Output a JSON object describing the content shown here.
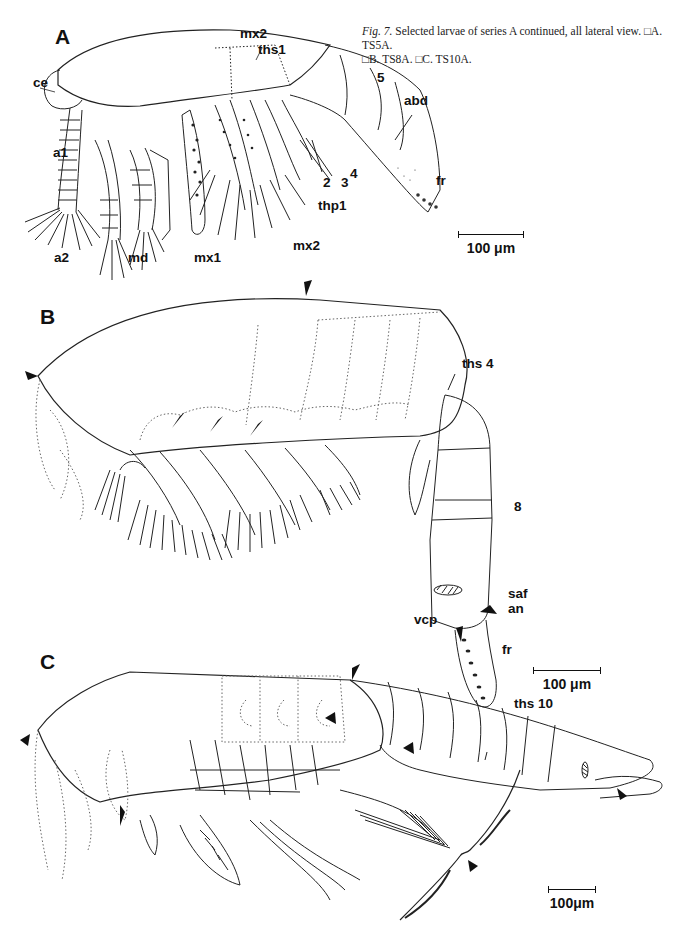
{
  "caption": {
    "fig_ref": "Fig. 7.",
    "text_line1": " Selected larvae of series A continued, all lateral view. □A. TS5A.",
    "text_line2": "□B. TS8A. □C. TS10A."
  },
  "panels": {
    "A": {
      "letter": "A",
      "stage": "TS5A",
      "labels": {
        "ce": "ce",
        "a1": "a1",
        "a2": "a2",
        "md": "md",
        "mx1": "mx1",
        "mx2_top": "mx2",
        "mx2_bottom": "mx2",
        "ths1": "ths1",
        "thp1": "thp1",
        "seg2": "2",
        "seg3": "3",
        "seg4": "4",
        "seg5": "5",
        "abd": "abd",
        "fr": "fr"
      },
      "scale_bar": "100 μm"
    },
    "B": {
      "letter": "B",
      "stage": "TS8A",
      "labels": {
        "ths4": "ths 4",
        "seg8": "8",
        "saf": "saf",
        "an": "an",
        "vcp": "vcp",
        "fr": "fr"
      },
      "scale_bar": "100 μm"
    },
    "C": {
      "letter": "C",
      "stage": "TS10A",
      "labels": {
        "ths10": "ths 10"
      },
      "scale_bar": "100μm"
    }
  }
}
